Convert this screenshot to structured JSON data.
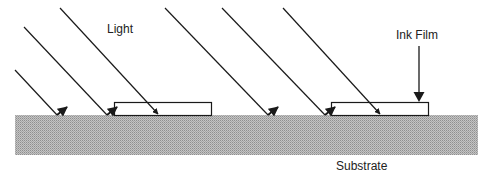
{
  "diagram": {
    "labels": {
      "light": "Light",
      "ink_film": "Ink Film",
      "substrate": "Substrate"
    },
    "colors": {
      "line": "#1a1a1a",
      "substrate_light": "#d8d8d8",
      "substrate_dark": "#8c8c8c",
      "film_fill": "#ffffff"
    },
    "substrate": {
      "x": 15,
      "y": 115,
      "width": 463,
      "height": 40
    },
    "films": [
      {
        "x": 114,
        "y": 102,
        "width": 97,
        "height": 13
      },
      {
        "x": 331,
        "y": 102,
        "width": 97,
        "height": 13
      }
    ],
    "rays": [
      {
        "type": "reflected",
        "from": [
          15,
          70
        ],
        "to": [
          57,
          115
        ]
      },
      {
        "type": "reflected",
        "from": [
          24,
          27
        ],
        "to": [
          107,
          115
        ]
      },
      {
        "type": "absorbed",
        "from": [
          60,
          8
        ],
        "to": [
          158,
          114
        ]
      },
      {
        "type": "reflected",
        "from": [
          165,
          8
        ],
        "to": [
          268,
          115
        ]
      },
      {
        "type": "reflected",
        "from": [
          222,
          8
        ],
        "to": [
          325,
          115
        ]
      },
      {
        "type": "absorbed",
        "from": [
          283,
          8
        ],
        "to": [
          380,
          114
        ]
      }
    ]
  }
}
